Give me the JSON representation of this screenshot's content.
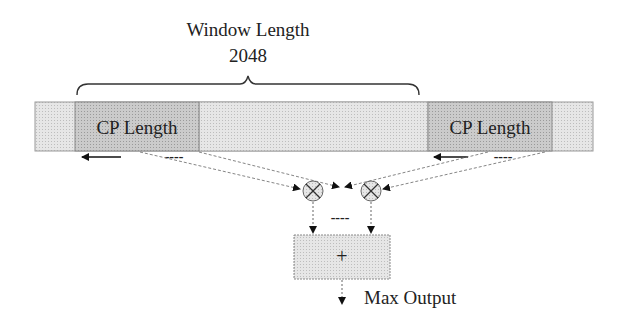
{
  "diagram": {
    "window": {
      "title": "Window Length",
      "value": "2048"
    },
    "cp_left": {
      "label": "CP Length"
    },
    "cp_right": {
      "label": "CP Length"
    },
    "adder": {
      "symbol": "+"
    },
    "output": {
      "label": "Max Output"
    },
    "ellipsis": "----",
    "multiplier_symbol": "X",
    "colors": {
      "outer_bar": "#e2e2e2",
      "cp_box": "#c8c8c8",
      "window_fill": "#dcdcdc",
      "adder_fill": "#e4e4e4",
      "stroke": "#6e6e6e",
      "arrow": "#111111"
    }
  }
}
